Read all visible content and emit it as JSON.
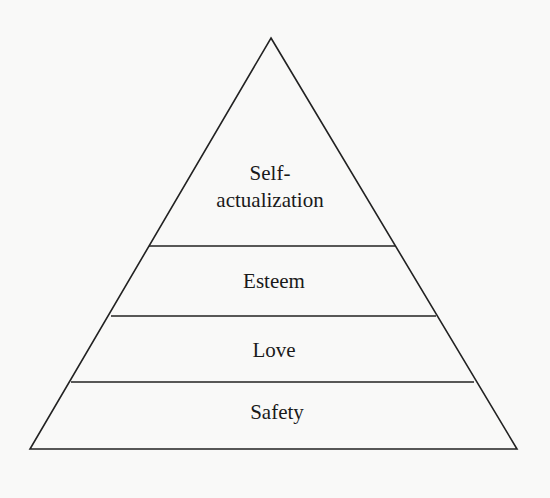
{
  "diagram": {
    "type": "pyramid",
    "colors": {
      "background": "#f9f9f8",
      "stroke": "#222222",
      "text": "#1a1a1a"
    },
    "levels": [
      {
        "label_line1": "Self-",
        "label_line2": "actualization"
      },
      {
        "label": "Esteem"
      },
      {
        "label": "Love"
      },
      {
        "label": "Safety"
      }
    ]
  }
}
